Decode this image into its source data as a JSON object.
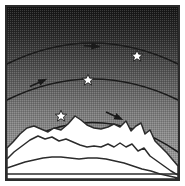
{
  "figure": {
    "width": 185,
    "height": 186
  },
  "frame": {
    "margin_px": 5,
    "border_color": "#2b2b2b",
    "border_width_px": 2,
    "margin_color": "#ffffff"
  },
  "sky": {
    "name": "gradient-sky",
    "top_color": "#1d1d1d",
    "mid_color": "#5a5a5a",
    "bottom_color": "#9a9a9a",
    "texture": "halftone-dither"
  },
  "arcs": [
    {
      "id": "arc-1",
      "label": "upper trajectory",
      "path": "M 7 64 Q 92 22 178 64",
      "stroke": "#1a1a1a",
      "stroke_width": 1.6,
      "arrow": {
        "x": 93,
        "y": 46,
        "angle": 0
      },
      "star": {
        "x": 137,
        "y": 56,
        "size": 11
      }
    },
    {
      "id": "arc-2",
      "label": "middle trajectory",
      "path": "M 7 100 Q 92 58 178 100",
      "stroke": "#1a1a1a",
      "stroke_width": 1.6,
      "arrow": {
        "x": 43,
        "y": 81,
        "angle": -26
      },
      "star": {
        "x": 88,
        "y": 81,
        "size": 11
      }
    },
    {
      "id": "arc-3",
      "label": "lower trajectory",
      "path": "M 7 150 Q 92 95 178 150",
      "stroke": "#1a1a1a",
      "stroke_width": 1.6,
      "arrow": {
        "x": 118,
        "y": 117,
        "angle": 22
      },
      "star": {
        "x": 61,
        "y": 117,
        "size": 11
      }
    }
  ],
  "stars": {
    "fill": "#ffffff",
    "stroke": "#1a1a1a",
    "count": 3
  },
  "arrows": {
    "fill": "#1a1a1a",
    "count": 3
  },
  "ridges": [
    {
      "id": "ridge-back",
      "label": "back mountain ridge",
      "fill": "#ffffff",
      "stroke": "#2b2b2b",
      "path": "M 7 180 L 7 148 L 14 142 L 22 133 L 30 128 L 38 126 L 46 129 L 54 132 L 62 128 L 70 130 L 78 124 L 86 115 L 94 121 L 100 126 L 108 128 L 116 129 L 124 126 L 131 124 L 136 127 L 141 122 L 145 132 L 150 127 L 155 138 L 160 144 L 166 149 L 172 156 L 178 163 L 178 180 Z"
    },
    {
      "id": "ridge-middle",
      "label": "middle mountain ridge",
      "fill": "#ffffff",
      "stroke": "#2b2b2b",
      "path": "M 7 180 L 7 158 L 15 151 L 24 145 L 32 140 L 40 136 L 48 139 L 56 137 L 63 141 L 70 139 L 78 142 L 86 145 L 94 147 L 102 145 L 110 147 L 116 142 L 122 146 L 128 144 L 134 150 L 140 148 L 146 154 L 154 159 L 162 164 L 170 169 L 178 173 L 178 180 Z"
    },
    {
      "id": "ridge-front",
      "label": "front mountain ridge",
      "fill": "#ffffff",
      "stroke": "#2b2b2b",
      "path": "M 7 180 L 7 167 L 16 164 L 26 161 L 36 159 L 46 158 L 56 157 L 66 157 L 76 158 L 86 158 L 96 157 L 106 158 L 116 160 L 126 162 L 136 165 L 146 168 L 156 171 L 166 174 L 178 177 L 178 180 Z"
    }
  ],
  "baseline": {
    "label": "ground-baseline",
    "y": 174,
    "color": "#2b2b2b"
  }
}
